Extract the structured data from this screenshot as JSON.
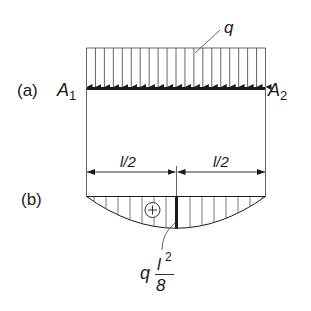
{
  "figure": {
    "load_label": "q",
    "panel_a_label": "(a)",
    "panel_b_label": "(b)",
    "support_left": {
      "base": "A",
      "sub": "1"
    },
    "support_right": {
      "base": "A",
      "sub": "2"
    },
    "dimension_left": "l/2",
    "dimension_right": "l/2",
    "sign_symbol": "+",
    "max_moment": {
      "coef": "q",
      "num_base": "l",
      "num_sup": "2",
      "den": "8"
    },
    "load_arrow_count": 21,
    "colors": {
      "ink": "#1a1a1a",
      "thin": "#555555",
      "background": "#ffffff"
    }
  }
}
